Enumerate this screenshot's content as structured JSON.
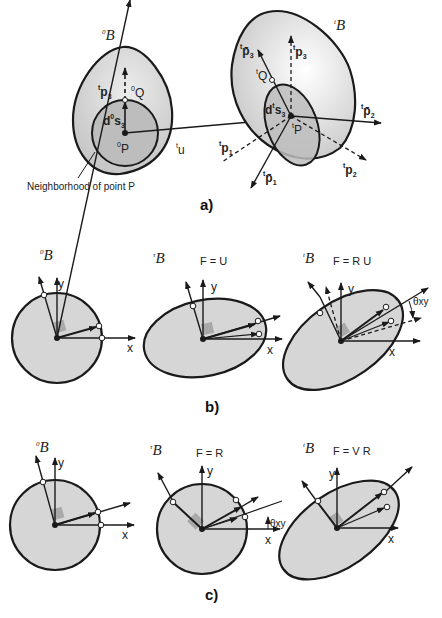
{
  "figure": {
    "panel_a": {
      "caption": "a)",
      "body_initial": "B",
      "body_initial_sup": "0",
      "body_current": "B",
      "body_current_sup": "t",
      "neighborhood_note": "Neighborhood of point P",
      "labels": {
        "p3_initial": "p",
        "Q0": "Q",
        "ds0": "d",
        "P0": "P",
        "u": "u",
        "p3bar": "p̄",
        "p3": "p",
        "Qt": "Q",
        "dst": "d",
        "Pt": "P",
        "p2bar": "p̄",
        "p1": "p",
        "p1bar": "p̄",
        "p2": "p"
      }
    },
    "panel_b": {
      "caption": "b)",
      "sub": [
        {
          "body": "B",
          "sup": "0",
          "equation": ""
        },
        {
          "body": "B",
          "sup": "τ",
          "equation": "F = U"
        },
        {
          "body": "B",
          "sup": "t",
          "equation": "F = R U"
        }
      ],
      "theta": "θxy",
      "axis_x": "x",
      "axis_y": "y"
    },
    "panel_c": {
      "caption": "c)",
      "sub": [
        {
          "body": "B",
          "sup": "0",
          "equation": ""
        },
        {
          "body": "B",
          "sup": "τ",
          "equation": "F = R"
        },
        {
          "body": "B",
          "sup": "t",
          "equation": "F = V R"
        }
      ],
      "theta": "θxy",
      "axis_x": "x",
      "axis_y": "y"
    },
    "colors": {
      "fill_light": "#d6d6d6",
      "fill_dark": "#bdbdbd",
      "stroke": "#1a1a1a"
    }
  }
}
